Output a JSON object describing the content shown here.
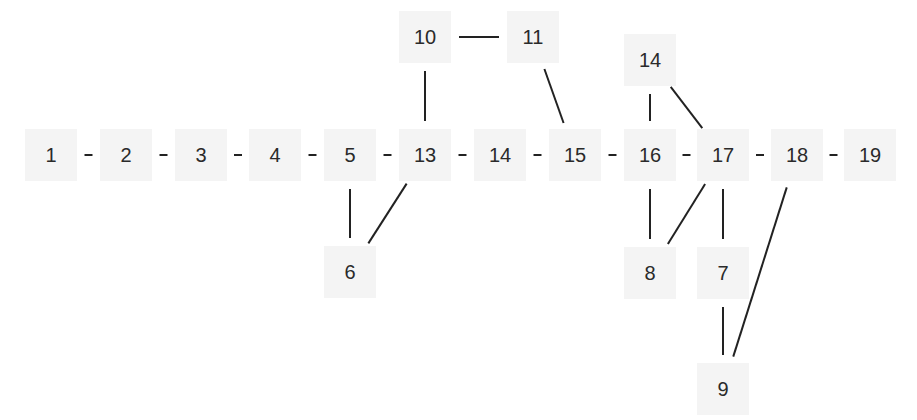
{
  "diagram": {
    "type": "undirected-graph",
    "node_fill": "#f4f4f4",
    "edge_color": "#222222",
    "nodes": [
      {
        "id": "n1",
        "label": "1",
        "x": 51,
        "y": 155
      },
      {
        "id": "n2",
        "label": "2",
        "x": 126,
        "y": 155
      },
      {
        "id": "n3",
        "label": "3",
        "x": 201,
        "y": 155
      },
      {
        "id": "n4",
        "label": "4",
        "x": 275,
        "y": 155
      },
      {
        "id": "n5",
        "label": "5",
        "x": 350,
        "y": 155
      },
      {
        "id": "n13a",
        "label": "13",
        "x": 425,
        "y": 155
      },
      {
        "id": "n14a",
        "label": "14",
        "x": 500,
        "y": 155
      },
      {
        "id": "n15",
        "label": "15",
        "x": 575,
        "y": 155
      },
      {
        "id": "n16",
        "label": "16",
        "x": 650,
        "y": 155
      },
      {
        "id": "n17",
        "label": "17",
        "x": 723,
        "y": 155
      },
      {
        "id": "n18",
        "label": "18",
        "x": 797,
        "y": 155
      },
      {
        "id": "n19",
        "label": "19",
        "x": 870,
        "y": 155
      },
      {
        "id": "n6",
        "label": "6",
        "x": 350,
        "y": 272
      },
      {
        "id": "n10",
        "label": "10",
        "x": 425,
        "y": 37
      },
      {
        "id": "n11",
        "label": "11",
        "x": 533,
        "y": 37
      },
      {
        "id": "n14b",
        "label": "14",
        "x": 650,
        "y": 60
      },
      {
        "id": "n8",
        "label": "8",
        "x": 650,
        "y": 273
      },
      {
        "id": "n7",
        "label": "7",
        "x": 723,
        "y": 273
      },
      {
        "id": "n9",
        "label": "9",
        "x": 723,
        "y": 389
      }
    ],
    "edges": [
      [
        "n1",
        "n2"
      ],
      [
        "n2",
        "n3"
      ],
      [
        "n3",
        "n4"
      ],
      [
        "n4",
        "n5"
      ],
      [
        "n5",
        "n13a"
      ],
      [
        "n13a",
        "n14a"
      ],
      [
        "n14a",
        "n15"
      ],
      [
        "n15",
        "n16"
      ],
      [
        "n16",
        "n17"
      ],
      [
        "n17",
        "n18"
      ],
      [
        "n18",
        "n19"
      ],
      [
        "n5",
        "n6"
      ],
      [
        "n13a",
        "n6"
      ],
      [
        "n10",
        "n11"
      ],
      [
        "n10",
        "n13a"
      ],
      [
        "n11",
        "n15"
      ],
      [
        "n14b",
        "n16"
      ],
      [
        "n14b",
        "n17"
      ],
      [
        "n16",
        "n8"
      ],
      [
        "n17",
        "n8"
      ],
      [
        "n17",
        "n7"
      ],
      [
        "n7",
        "n9"
      ],
      [
        "n18",
        "n9"
      ]
    ]
  }
}
